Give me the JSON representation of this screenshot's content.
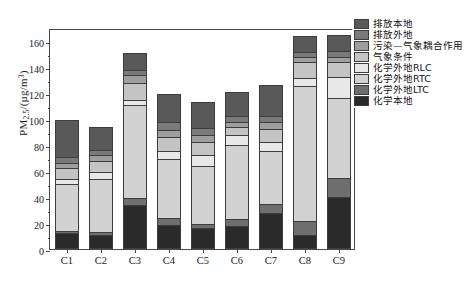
{
  "chart_data": {
    "type": "bar",
    "subtype": "stacked",
    "title": "",
    "xlabel": "",
    "ylabel": "PM2.5/(μg/m³)",
    "ylabel_parts": {
      "prefix": "PM",
      "sub": "2.5",
      "mid": "/(μg/m",
      "sup": "3",
      "suffix": ")"
    },
    "ylim": [
      0,
      170
    ],
    "yticks": [
      0,
      20,
      40,
      60,
      80,
      100,
      120,
      140,
      160
    ],
    "ytick_labels": [
      "0",
      "20",
      "40",
      "60",
      "80",
      "100",
      "120",
      "140",
      "160"
    ],
    "grid": false,
    "legend_position": "outside-top-right",
    "categories": [
      "C1",
      "C2",
      "C3",
      "C4",
      "C5",
      "C6",
      "C7",
      "C8",
      "C9"
    ],
    "series": [
      {
        "name": "化学本地",
        "color": "#2a2a2a",
        "values": [
          12.0,
          11.0,
          34.0,
          18.5,
          16.0,
          17.5,
          28.0,
          10.5,
          40.0
        ]
      },
      {
        "name": "化学外地LTC",
        "color": "#6e6e6e",
        "values": [
          2.0,
          2.0,
          5.0,
          5.0,
          3.0,
          5.5,
          6.5,
          11.0,
          15.0
        ]
      },
      {
        "name": "化学外地RTC",
        "color": "#d2d2d2",
        "values": [
          36.0,
          41.0,
          72.0,
          46.0,
          45.0,
          57.0,
          41.0,
          104.0,
          61.0
        ]
      },
      {
        "name": "化学外地RLC",
        "color": "#e8e8e8",
        "values": [
          4.0,
          5.0,
          4.0,
          6.0,
          8.0,
          8.0,
          7.0,
          6.0,
          16.0
        ]
      },
      {
        "name": "气象条件",
        "color": "#c4c4c4",
        "values": [
          8.0,
          9.0,
          13.0,
          11.0,
          10.0,
          6.0,
          10.0,
          12.0,
          12.0
        ]
      },
      {
        "name": "污染—气象耦合作用",
        "color": "#9e9e9e",
        "values": [
          4.0,
          4.0,
          6.0,
          5.0,
          6.0,
          4.0,
          5.0,
          4.0,
          4.0
        ]
      },
      {
        "name": "排放外地",
        "color": "#7a7a7a",
        "values": [
          5.0,
          4.0,
          4.0,
          6.0,
          5.0,
          4.0,
          5.0,
          4.0,
          4.0
        ]
      },
      {
        "name": "排放本地",
        "color": "#595959",
        "values": [
          28.0,
          18.0,
          13.0,
          22.0,
          20.0,
          19.0,
          24.0,
          12.0,
          13.0
        ]
      }
    ],
    "totals": [
      99.0,
      94.0,
      151.0,
      119.5,
      113.0,
      121.0,
      126.5,
      163.5,
      165.0
    ]
  },
  "legend": {
    "entries": [
      {
        "label": "排放本地",
        "color": "#595959"
      },
      {
        "label": "排放外地",
        "color": "#7a7a7a"
      },
      {
        "label": "污染—气象耦合作用",
        "color": "#9e9e9e"
      },
      {
        "label": "气象条件",
        "color": "#c4c4c4"
      },
      {
        "label": "化学外地RLC",
        "color": "#e8e8e8"
      },
      {
        "label": "化学外地RTC",
        "color": "#d2d2d2"
      },
      {
        "label": "化学外地LTC",
        "color": "#6e6e6e"
      },
      {
        "label": "化学本地",
        "color": "#2a2a2a"
      }
    ]
  }
}
